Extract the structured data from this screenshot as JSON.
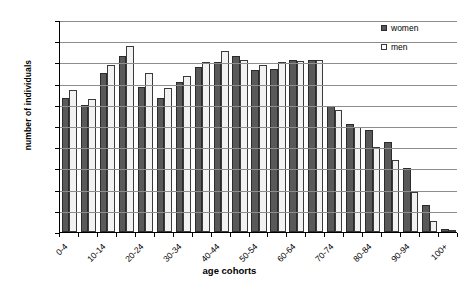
{
  "chart_data": {
    "type": "bar",
    "title": "",
    "xlabel": "age cohorts",
    "ylabel": "number of individuals",
    "ylim": [
      0,
      50000
    ],
    "ytick_values": [
      0,
      5000,
      10000,
      15000,
      20000,
      25000,
      30000,
      35000,
      40000,
      45000,
      50000
    ],
    "ytick_labels": [
      "0",
      "5000",
      "10000",
      "15000",
      "20000",
      "25000",
      "30000",
      "35000",
      "40000",
      "45000",
      "50000"
    ],
    "grid": true,
    "legend_position": "top-right",
    "categories": [
      "0-4",
      "5-9",
      "10-14",
      "15-19",
      "20-24",
      "25-29",
      "30-34",
      "35-39",
      "40-44",
      "45-49",
      "50-54",
      "55-59",
      "60-64",
      "65-69",
      "70-74",
      "75-79",
      "80-84",
      "85-89",
      "90-94",
      "95-99",
      "100+"
    ],
    "xtick_labels_shown": [
      "0-4",
      "10-14",
      "20-24",
      "30-34",
      "40-44",
      "50-54",
      "60-64",
      "70-74",
      "80-84",
      "90-94",
      "100+"
    ],
    "series": [
      {
        "name": "women",
        "color": "#595959",
        "values": [
          31600,
          30000,
          37500,
          41500,
          34300,
          31500,
          35300,
          39000,
          40200,
          41400,
          38300,
          38500,
          40600,
          40500,
          29800,
          25500,
          24000,
          21300,
          15000,
          6300,
          800
        ]
      },
      {
        "name": "men",
        "color": "#f2f2f2",
        "values": [
          33400,
          31300,
          39400,
          43800,
          37400,
          33900,
          36700,
          40200,
          42800,
          40500,
          39400,
          40000,
          40300,
          40600,
          28700,
          24700,
          20000,
          17000,
          9500,
          2600,
          300
        ]
      }
    ]
  },
  "legend": {
    "items": [
      {
        "label": "women",
        "style": "women"
      },
      {
        "label": "men",
        "style": "men"
      }
    ]
  },
  "axis": {
    "x_title": "age cohorts",
    "y_title": "number of individuals"
  },
  "caption": ""
}
